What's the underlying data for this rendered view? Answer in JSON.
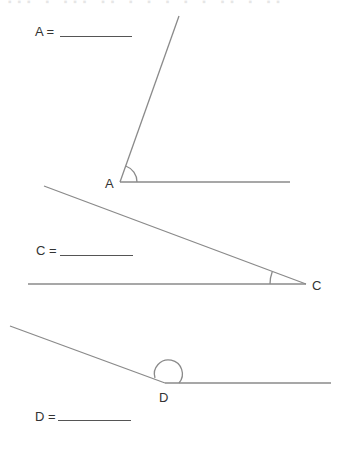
{
  "worksheet": {
    "top_cutoff_text": "▪▪▪ ▪ ▪▪▪ ▪▪ ▪ ▪ ▪ ▪ ▪ ▪▪ ▪ ▪▪",
    "line_color": "#8a8a8a",
    "text_color": "#333333",
    "angles": [
      {
        "id": "A",
        "answer_label": "A =",
        "answer_value": "",
        "vertex_label": "A",
        "vertex": [
          120,
          182
        ],
        "arm1_end": [
          179,
          16
        ],
        "arm2_end": [
          290,
          182
        ],
        "arc": "acute, drawn between arms near vertex"
      },
      {
        "id": "C",
        "answer_label": "C =",
        "answer_value": "",
        "vertex_label": "C",
        "vertex": [
          306,
          284
        ],
        "arm1_end": [
          44,
          186
        ],
        "arm2_end": [
          28,
          284
        ],
        "arc": "small acute arc"
      },
      {
        "id": "D",
        "answer_label": "D =",
        "answer_value": "",
        "vertex_label": "D",
        "vertex": [
          165,
          383
        ],
        "arm1_end": [
          10,
          326
        ],
        "arm2_end": [
          331,
          383
        ],
        "arc": "obtuse semicircle-like arc"
      }
    ]
  }
}
